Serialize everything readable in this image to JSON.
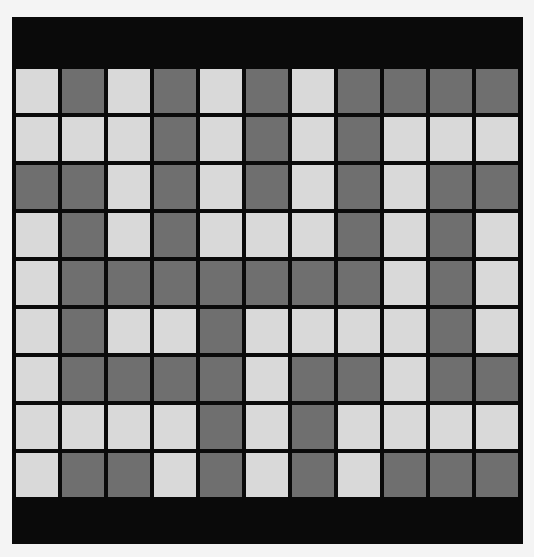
{
  "board": {
    "rows": 9,
    "cols": 11,
    "legend": {
      "L": "light",
      "D": "dark"
    },
    "colors": {
      "frame": "#0a0a0a",
      "light": "#d9d9d9",
      "dark": "#6f6f6f",
      "background": "#f4f4f4"
    },
    "grid": [
      [
        "L",
        "D",
        "L",
        "D",
        "L",
        "D",
        "L",
        "D",
        "D",
        "D",
        "D"
      ],
      [
        "L",
        "L",
        "L",
        "D",
        "L",
        "D",
        "L",
        "D",
        "L",
        "L",
        "L"
      ],
      [
        "D",
        "D",
        "L",
        "D",
        "L",
        "D",
        "L",
        "D",
        "L",
        "D",
        "D"
      ],
      [
        "L",
        "D",
        "L",
        "D",
        "L",
        "L",
        "L",
        "D",
        "L",
        "D",
        "L"
      ],
      [
        "L",
        "D",
        "D",
        "D",
        "D",
        "D",
        "D",
        "D",
        "L",
        "D",
        "L"
      ],
      [
        "L",
        "D",
        "L",
        "L",
        "D",
        "L",
        "L",
        "L",
        "L",
        "D",
        "L"
      ],
      [
        "L",
        "D",
        "D",
        "D",
        "D",
        "L",
        "D",
        "D",
        "L",
        "D",
        "D"
      ],
      [
        "L",
        "L",
        "L",
        "L",
        "D",
        "L",
        "D",
        "L",
        "L",
        "L",
        "L"
      ],
      [
        "L",
        "D",
        "D",
        "L",
        "D",
        "L",
        "D",
        "L",
        "D",
        "D",
        "D"
      ]
    ]
  }
}
